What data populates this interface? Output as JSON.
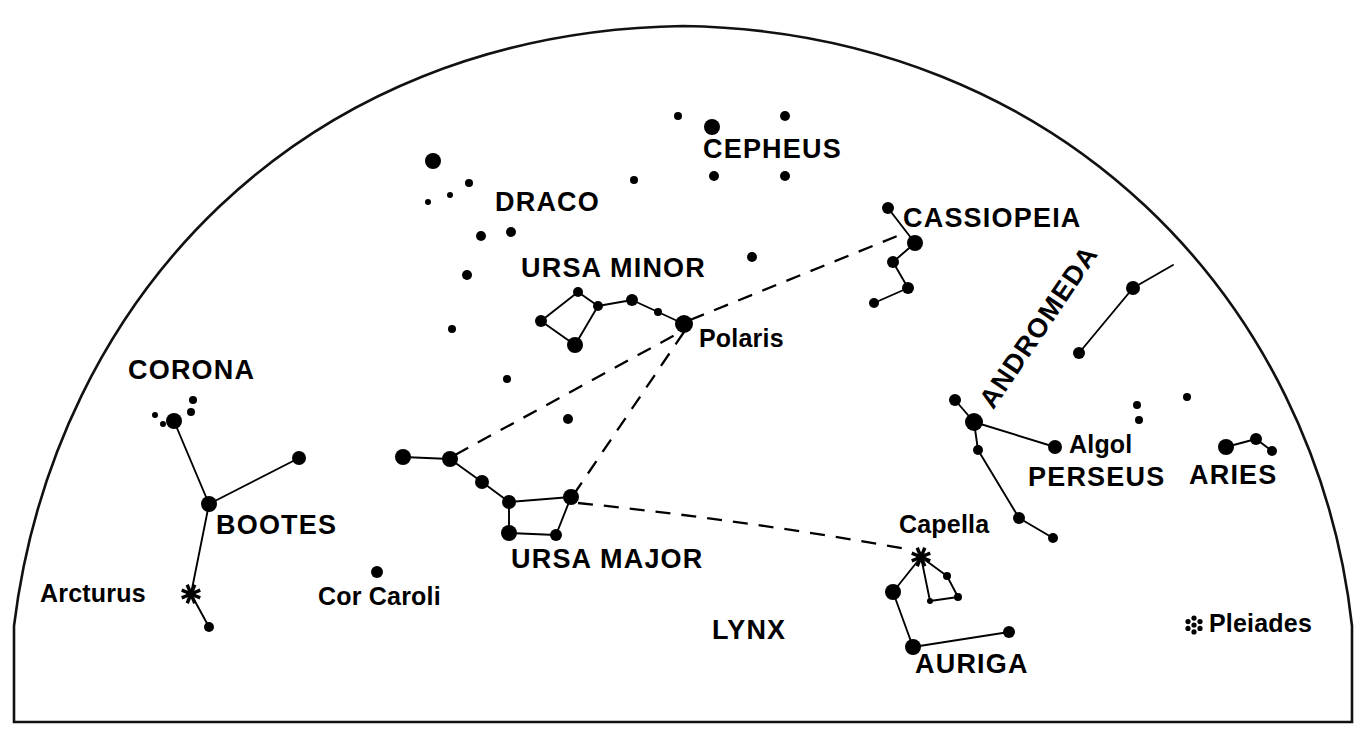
{
  "figure": {
    "kind": "star-chart",
    "title_visible": false,
    "background_color": "#ffffff",
    "ink_color": "#000000",
    "frame_description": "half-dome horizon frame, flat bottom"
  },
  "chart_data": {
    "type": "scatter",
    "title": "",
    "subtitle": "",
    "xlabel": "",
    "ylabel": "",
    "xlim": [
      0,
      1366
    ],
    "ylim": [
      747,
      0
    ],
    "grid": false,
    "legend": "none",
    "projection": "sky dome / horizon half-dome",
    "frame": {
      "name": "horizon-dome",
      "bottom_y": 722,
      "left_x": 14,
      "right_x": 1352,
      "apex_x": 683,
      "apex_y": 26,
      "stroke_width": 2.6
    },
    "labels": [
      {
        "name": "CEPHEUS",
        "text": "CEPHEUS",
        "x": 703,
        "y": 136,
        "size": "major",
        "rotation": 0
      },
      {
        "name": "DRACO",
        "text": "DRACO",
        "x": 495,
        "y": 189,
        "size": "major",
        "rotation": 0
      },
      {
        "name": "CASSIOPEIA",
        "text": "CASSIOPEIA",
        "x": 903,
        "y": 205,
        "size": "major",
        "rotation": 0
      },
      {
        "name": "URSA MINOR",
        "text": "URSA MINOR",
        "x": 521,
        "y": 255,
        "size": "major",
        "rotation": 0
      },
      {
        "name": "Polaris",
        "text": "Polaris",
        "x": 699,
        "y": 326,
        "size": "minor",
        "rotation": 0
      },
      {
        "name": "ANDROMEDA",
        "text": "ANDROMEDA",
        "x": 975,
        "y": 398,
        "size": "major",
        "rotation": -56
      },
      {
        "name": "CORONA",
        "text": "CORONA",
        "x": 128,
        "y": 357,
        "size": "major",
        "rotation": 0
      },
      {
        "name": "Algol",
        "text": "Algol",
        "x": 1069,
        "y": 432,
        "size": "minor",
        "rotation": 0
      },
      {
        "name": "PERSEUS",
        "text": "PERSEUS",
        "x": 1028,
        "y": 464,
        "size": "major",
        "rotation": 0
      },
      {
        "name": "ARIES",
        "text": "ARIES",
        "x": 1189,
        "y": 462,
        "size": "major",
        "rotation": 0
      },
      {
        "name": "BOOTES",
        "text": "BOOTES",
        "x": 216,
        "y": 512,
        "size": "major",
        "rotation": 0
      },
      {
        "name": "Capella",
        "text": "Capella",
        "x": 899,
        "y": 512,
        "size": "minor",
        "rotation": 0
      },
      {
        "name": "URSA MAJOR",
        "text": "URSA MAJOR",
        "x": 511,
        "y": 546,
        "size": "major",
        "rotation": 0
      },
      {
        "name": "Arcturus",
        "text": "Arcturus",
        "x": 40,
        "y": 581,
        "size": "minor",
        "rotation": 0
      },
      {
        "name": "Cor Caroli",
        "text": "Cor Caroli",
        "x": 318,
        "y": 584,
        "size": "minor",
        "rotation": 0
      },
      {
        "name": "LYNX",
        "text": "LYNX",
        "x": 712,
        "y": 617,
        "size": "major",
        "rotation": 0
      },
      {
        "name": "Pleiades",
        "text": "Pleiades",
        "x": 1209,
        "y": 611,
        "size": "minor",
        "rotation": 0
      },
      {
        "name": "AURIGA",
        "text": "AURIGA",
        "x": 915,
        "y": 651,
        "size": "major",
        "rotation": 0
      }
    ],
    "constellations": [
      {
        "name": "ursa-minor",
        "label": "URSA MINOR",
        "stars": [
          {
            "id": "um1",
            "x": 578,
            "y": 292,
            "r": 5
          },
          {
            "id": "um2",
            "x": 541,
            "y": 321,
            "r": 6
          },
          {
            "id": "um3",
            "x": 575,
            "y": 345,
            "r": 8
          },
          {
            "id": "um4",
            "x": 598,
            "y": 306,
            "r": 5
          },
          {
            "id": "um5",
            "x": 632,
            "y": 300,
            "r": 6
          },
          {
            "id": "um6",
            "x": 658,
            "y": 312,
            "r": 4
          },
          {
            "id": "polaris",
            "x": 684,
            "y": 324,
            "r": 9
          }
        ],
        "lines": [
          [
            "um1",
            "um2"
          ],
          [
            "um2",
            "um3"
          ],
          [
            "um3",
            "um4"
          ],
          [
            "um4",
            "um1"
          ],
          [
            "um4",
            "um5"
          ],
          [
            "um5",
            "um6"
          ],
          [
            "um6",
            "polaris"
          ]
        ]
      },
      {
        "name": "ursa-major",
        "label": "URSA MAJOR",
        "stars": [
          {
            "id": "uj1",
            "x": 403,
            "y": 457,
            "r": 8
          },
          {
            "id": "uj2",
            "x": 450,
            "y": 459,
            "r": 8
          },
          {
            "id": "uj3",
            "x": 482,
            "y": 482,
            "r": 7
          },
          {
            "id": "uj4",
            "x": 509,
            "y": 502,
            "r": 7
          },
          {
            "id": "uj5",
            "x": 571,
            "y": 497,
            "r": 8
          },
          {
            "id": "uj6",
            "x": 556,
            "y": 535,
            "r": 6
          },
          {
            "id": "uj7",
            "x": 509,
            "y": 533,
            "r": 8
          }
        ],
        "lines": [
          [
            "uj1",
            "uj2"
          ],
          [
            "uj2",
            "uj3"
          ],
          [
            "uj3",
            "uj4"
          ],
          [
            "uj4",
            "uj5"
          ],
          [
            "uj5",
            "uj6"
          ],
          [
            "uj6",
            "uj7"
          ],
          [
            "uj7",
            "uj4"
          ]
        ]
      },
      {
        "name": "cassiopeia",
        "label": "CASSIOPEIA",
        "stars": [
          {
            "id": "ca1",
            "x": 888,
            "y": 208,
            "r": 6
          },
          {
            "id": "ca2",
            "x": 915,
            "y": 243,
            "r": 8
          },
          {
            "id": "ca3",
            "x": 893,
            "y": 262,
            "r": 6
          },
          {
            "id": "ca4",
            "x": 908,
            "y": 288,
            "r": 6
          },
          {
            "id": "ca5",
            "x": 874,
            "y": 303,
            "r": 5
          }
        ],
        "lines": [
          [
            "ca1",
            "ca2"
          ],
          [
            "ca2",
            "ca3"
          ],
          [
            "ca3",
            "ca4"
          ],
          [
            "ca4",
            "ca5"
          ]
        ]
      },
      {
        "name": "andromeda",
        "label": "ANDROMEDA",
        "stars": [
          {
            "id": "an1",
            "x": 1133,
            "y": 288,
            "r": 7
          },
          {
            "id": "an2",
            "x": 1079,
            "y": 353,
            "r": 6
          },
          {
            "id": "an3",
            "x": 1173,
            "y": 265,
            "r": 0
          }
        ],
        "lines": [
          [
            "an1",
            "an2"
          ],
          [
            "an1",
            "an3"
          ]
        ]
      },
      {
        "name": "perseus",
        "label": "PERSEUS",
        "stars": [
          {
            "id": "pe1",
            "x": 955,
            "y": 400,
            "r": 6
          },
          {
            "id": "pe2",
            "x": 974,
            "y": 422,
            "r": 9
          },
          {
            "id": "pe3",
            "x": 1055,
            "y": 447,
            "r": 7
          },
          {
            "id": "pe4",
            "x": 978,
            "y": 450,
            "r": 5
          },
          {
            "id": "pe5",
            "x": 1019,
            "y": 518,
            "r": 6
          },
          {
            "id": "pe6",
            "x": 1053,
            "y": 538,
            "r": 5
          }
        ],
        "lines": [
          [
            "pe1",
            "pe2"
          ],
          [
            "pe2",
            "pe3"
          ],
          [
            "pe2",
            "pe4"
          ],
          [
            "pe4",
            "pe5"
          ],
          [
            "pe5",
            "pe6"
          ]
        ]
      },
      {
        "name": "aries",
        "label": "ARIES",
        "stars": [
          {
            "id": "ar1",
            "x": 1226,
            "y": 447,
            "r": 8
          },
          {
            "id": "ar2",
            "x": 1256,
            "y": 439,
            "r": 6
          },
          {
            "id": "ar3",
            "x": 1272,
            "y": 451,
            "r": 5
          }
        ],
        "lines": [
          [
            "ar1",
            "ar2"
          ],
          [
            "ar2",
            "ar3"
          ]
        ]
      },
      {
        "name": "bootes",
        "label": "BOOTES",
        "stars": [
          {
            "id": "bo1",
            "x": 299,
            "y": 458,
            "r": 7
          },
          {
            "id": "bo2",
            "x": 209,
            "y": 504,
            "r": 8
          },
          {
            "id": "bo3",
            "x": 191,
            "y": 594,
            "r": 0
          },
          {
            "id": "bo4",
            "x": 209,
            "y": 627,
            "r": 5
          }
        ],
        "lines": [
          [
            "bo1",
            "bo2"
          ],
          [
            "bo2",
            "bo3"
          ],
          [
            "bo3",
            "bo4"
          ]
        ]
      },
      {
        "name": "corona",
        "label": "CORONA",
        "stars": [
          {
            "id": "co1",
            "x": 174,
            "y": 421,
            "r": 8
          },
          {
            "id": "co2",
            "x": 155,
            "y": 415,
            "r": 3
          },
          {
            "id": "co3",
            "x": 163,
            "y": 424,
            "r": 3
          },
          {
            "id": "co4",
            "x": 191,
            "y": 412,
            "r": 4
          },
          {
            "id": "co5",
            "x": 193,
            "y": 400,
            "r": 4
          }
        ],
        "lines": [
          [
            "co1",
            "bootes_link"
          ]
        ]
      },
      {
        "name": "auriga",
        "label": "AURIGA",
        "stars": [
          {
            "id": "au1",
            "x": 921,
            "y": 557,
            "r": 0
          },
          {
            "id": "au2",
            "x": 893,
            "y": 592,
            "r": 8
          },
          {
            "id": "au3",
            "x": 913,
            "y": 647,
            "r": 8
          },
          {
            "id": "au4",
            "x": 1009,
            "y": 632,
            "r": 6
          },
          {
            "id": "au5",
            "x": 947,
            "y": 576,
            "r": 4
          },
          {
            "id": "au6",
            "x": 958,
            "y": 597,
            "r": 4
          },
          {
            "id": "au7",
            "x": 930,
            "y": 601,
            "r": 3
          }
        ],
        "lines": [
          [
            "au1",
            "au2"
          ],
          [
            "au2",
            "au3"
          ],
          [
            "au3",
            "au4"
          ],
          [
            "au1",
            "au5"
          ],
          [
            "au5",
            "au6"
          ],
          [
            "au6",
            "au7"
          ],
          [
            "au7",
            "au1"
          ]
        ]
      }
    ],
    "special_stars": [
      {
        "name": "Arcturus",
        "glyph": "asterisk",
        "x": 191,
        "y": 594,
        "size": 20
      },
      {
        "name": "Capella",
        "glyph": "asterisk",
        "x": 921,
        "y": 557,
        "size": 20
      }
    ],
    "clusters": [
      {
        "name": "Pleiades",
        "glyph": "rosette",
        "x": 1194,
        "y": 625,
        "size": 18
      }
    ],
    "field_stars": [
      {
        "name": "draco-1",
        "x": 433,
        "y": 161,
        "r": 8
      },
      {
        "name": "draco-2",
        "x": 469,
        "y": 183,
        "r": 4
      },
      {
        "name": "draco-3",
        "x": 450,
        "y": 195,
        "r": 3
      },
      {
        "name": "draco-4",
        "x": 428,
        "y": 202,
        "r": 3
      },
      {
        "name": "draco-5",
        "x": 481,
        "y": 236,
        "r": 5
      },
      {
        "name": "draco-6",
        "x": 511,
        "y": 232,
        "r": 5
      },
      {
        "name": "draco-7",
        "x": 467,
        "y": 275,
        "r": 5
      },
      {
        "name": "draco-8",
        "x": 452,
        "y": 329,
        "r": 4
      },
      {
        "name": "draco-9",
        "x": 507,
        "y": 379,
        "r": 4
      },
      {
        "name": "draco-10",
        "x": 504,
        "y": 379,
        "r": 0
      },
      {
        "name": "draco-11",
        "x": 568,
        "y": 419,
        "r": 5
      },
      {
        "name": "draco-12",
        "x": 504,
        "y": 380,
        "r": 0
      },
      {
        "name": "cepheus-1",
        "x": 678,
        "y": 116,
        "r": 4
      },
      {
        "name": "cepheus-2",
        "x": 712,
        "y": 127,
        "r": 8
      },
      {
        "name": "cepheus-3",
        "x": 785,
        "y": 116,
        "r": 5
      },
      {
        "name": "cepheus-4",
        "x": 714,
        "y": 176,
        "r": 5
      },
      {
        "name": "cepheus-5",
        "x": 785,
        "y": 176,
        "r": 5
      },
      {
        "name": "cepheus-6",
        "x": 634,
        "y": 180,
        "r": 4
      },
      {
        "name": "umi-field",
        "x": 752,
        "y": 257,
        "r": 5
      },
      {
        "name": "draco-13",
        "x": 511,
        "y": 232,
        "r": 0
      },
      {
        "name": "cor-caroli",
        "x": 377,
        "y": 572,
        "r": 6
      },
      {
        "name": "and-field-1",
        "x": 1137,
        "y": 405,
        "r": 4
      },
      {
        "name": "and-field-2",
        "x": 1139,
        "y": 420,
        "r": 4
      },
      {
        "name": "and-field-3",
        "x": 1187,
        "y": 397,
        "r": 4
      }
    ],
    "pointer_lines": [
      {
        "name": "polaris-to-cassiopeia",
        "from": {
          "x": 690,
          "y": 320
        },
        "to": {
          "x": 907,
          "y": 232
        },
        "style": "dashed"
      },
      {
        "name": "big-dipper-pointer",
        "from": {
          "x": 455,
          "y": 455
        },
        "to": {
          "x": 684,
          "y": 330
        },
        "style": "dashed"
      },
      {
        "name": "polaris-to-dipper-bowl",
        "from": {
          "x": 684,
          "y": 332
        },
        "to": {
          "x": 572,
          "y": 497
        },
        "style": "dashed"
      },
      {
        "name": "dipper-to-capella",
        "from": {
          "x": 578,
          "y": 503
        },
        "to": {
          "x": 912,
          "y": 550
        },
        "style": "dashed-curve",
        "control": {
          "x": 745,
          "y": 520
        }
      }
    ]
  }
}
